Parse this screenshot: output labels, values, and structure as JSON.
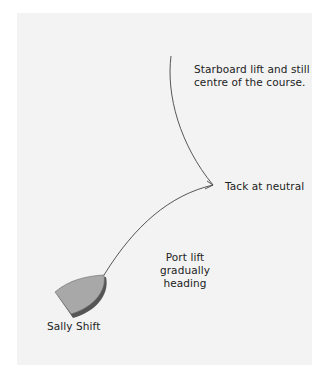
{
  "diagram": {
    "labels": {
      "starboard": "Starboard lift and still centre of the course.",
      "tack": "Tack at neutral",
      "port": "Port lift gradually heading",
      "boat": "Sally Shift"
    },
    "colors": {
      "background": "#f3f3f3",
      "track": "#444444",
      "boat_fill": "#a8a8a8",
      "boat_shadow": "#555555"
    },
    "track_points": {
      "start": [
        171,
        56
      ],
      "tack": [
        213,
        185
      ],
      "end": [
        104,
        275
      ]
    }
  }
}
